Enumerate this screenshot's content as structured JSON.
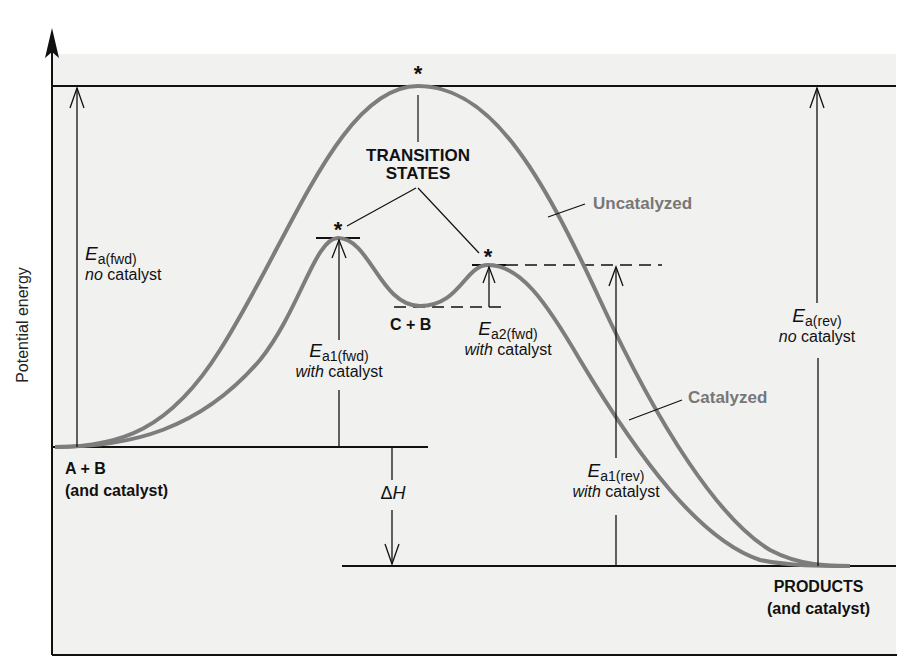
{
  "diagram": {
    "type": "reaction-energy-profile",
    "y_axis_label": "Potential energy",
    "colors": {
      "background": "#f1f1f0",
      "curve": "#7d7d7d",
      "line": "#111111",
      "gray_label": "#777777"
    },
    "transition_states": {
      "line1": "TRANSITION",
      "line2": "STATES",
      "marker": "*"
    },
    "curves": {
      "uncatalyzed": "Uncatalyzed",
      "catalyzed": "Catalyzed"
    },
    "species": {
      "reactants": {
        "line1": "A + B",
        "line2": "(and catalyst)"
      },
      "intermediate": "C + B",
      "products": {
        "line1": "PRODUCTS",
        "line2": "(and catalyst)"
      }
    },
    "energies": {
      "ea_fwd": {
        "E": "E",
        "sub": "a(fwd)",
        "mod": "no",
        "rest": " catalyst"
      },
      "ea1_fwd": {
        "E": "E",
        "sub": "a1(fwd)",
        "mod": "with",
        "rest": " catalyst"
      },
      "ea2_fwd": {
        "E": "E",
        "sub": "a2(fwd)",
        "mod": "with",
        "rest": " catalyst"
      },
      "ea_rev": {
        "E": "E",
        "sub": "a(rev)",
        "mod": "no",
        "rest": " catalyst"
      },
      "ea1_rev": {
        "E": "E",
        "sub": "a1(rev)",
        "mod": "with",
        "rest": " catalyst"
      },
      "delta_h": {
        "delta": "Δ",
        "H": "H"
      }
    }
  }
}
